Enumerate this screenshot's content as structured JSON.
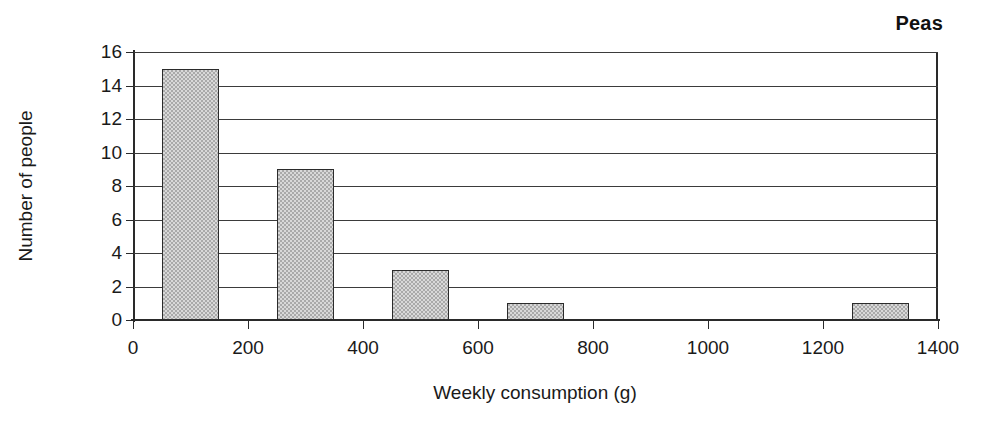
{
  "chart_data": {
    "type": "bar",
    "title": "Peas",
    "xlabel": "Weekly consumption (g)",
    "ylabel": "Number of people",
    "grid": true,
    "legend": null,
    "xlim": [
      0,
      1400
    ],
    "ylim": [
      0,
      16
    ],
    "x_ticks": [
      0,
      200,
      400,
      600,
      800,
      1000,
      1200,
      1400
    ],
    "y_ticks": [
      0,
      2,
      4,
      6,
      8,
      10,
      12,
      14,
      16
    ],
    "x_tick_labels": [
      "0",
      "200",
      "400",
      "600",
      "800",
      "1000",
      "1200",
      "1400"
    ],
    "y_tick_labels": [
      "0",
      "2",
      "4",
      "6",
      "8",
      "10",
      "12",
      "14",
      "16"
    ],
    "bin_width": 100,
    "bars": [
      {
        "label": "50-150",
        "bin_start": 50,
        "bin_end": 150,
        "center": 100,
        "value": 15
      },
      {
        "label": "250-350",
        "bin_start": 250,
        "bin_end": 350,
        "center": 300,
        "value": 9
      },
      {
        "label": "450-550",
        "bin_start": 450,
        "bin_end": 550,
        "center": 500,
        "value": 3
      },
      {
        "label": "650-750",
        "bin_start": 650,
        "bin_end": 750,
        "center": 700,
        "value": 1
      },
      {
        "label": "1250-1350",
        "bin_start": 1250,
        "bin_end": 1350,
        "center": 1300,
        "value": 1
      }
    ],
    "categories": [
      "100",
      "300",
      "500",
      "700",
      "1300"
    ],
    "values": [
      15,
      9,
      3,
      1,
      1
    ],
    "colors": {
      "bar_fill": "#a9a9a9",
      "bar_border": "#2b2b2b",
      "axis": "#2a2a2a",
      "grid": "#3b3b3b",
      "text": "#1a1a1a",
      "background": "#ffffff"
    }
  }
}
